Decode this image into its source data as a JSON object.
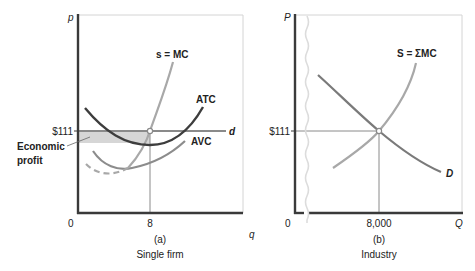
{
  "colors": {
    "axis": "#3a3a3a",
    "frame": "#d4d4d4",
    "atc": "#3d3d3d",
    "mc_supply": "#a8a8a8",
    "avc": "#8c8c8c",
    "demand": "#7a7a7a",
    "guide": "#8a8a8a",
    "profit_fill": "#d6d6d6",
    "break_line": "#dcdcdc"
  },
  "panel_a": {
    "y_axis_label": "p",
    "x_axis_label": "q",
    "origin_label": "0",
    "price_tick_label": "$111",
    "quantity_tick_label": "8",
    "caption_letter": "(a)",
    "caption_title": "Single firm",
    "curves": {
      "mc": "s = MC",
      "atc": "ATC",
      "avc": "AVC",
      "demand": "d"
    },
    "annotation": {
      "line1": "Economic",
      "line2": "profit"
    }
  },
  "panel_b": {
    "y_axis_label": "P",
    "x_axis_label": "Q",
    "origin_label": "0",
    "price_tick_label": "$111",
    "quantity_tick_label": "8,000",
    "caption_letter": "(b)",
    "caption_title": "Industry",
    "curves": {
      "supply": "S = ΣMC",
      "demand": "D"
    }
  }
}
